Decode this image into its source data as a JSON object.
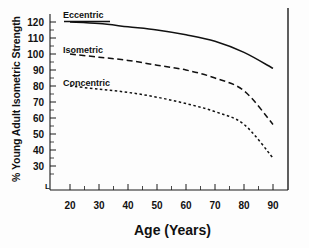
{
  "chart_data": {
    "type": "line",
    "title": "",
    "subtitle": "",
    "xlabel": "Age (Years)",
    "ylabel": "% Young Adult Isometric Strength",
    "xlim": [
      15,
      95
    ],
    "ylim": [
      25,
      127
    ],
    "xticks": [
      20,
      30,
      40,
      50,
      60,
      70,
      80,
      90
    ],
    "xtick_labels": [
      "20",
      "30",
      "40",
      "50",
      "60",
      "70",
      "80",
      "90"
    ],
    "yticks": [
      30,
      40,
      50,
      60,
      70,
      80,
      90,
      100,
      110,
      120
    ],
    "ytick_labels": [
      "30",
      "40",
      "50",
      "60",
      "70",
      "80",
      "90",
      "100",
      "110",
      "120"
    ],
    "grid": false,
    "legend_position": "inline-annotations",
    "x": [
      20,
      30,
      40,
      50,
      60,
      70,
      80,
      90
    ],
    "series": [
      {
        "name": "Eccentric",
        "style": "solid",
        "color": "#111111",
        "values": [
          120,
          119,
          117,
          115,
          112,
          108,
          101,
          91
        ]
      },
      {
        "name": "Isometric",
        "style": "dashed",
        "color": "#111111",
        "values": [
          100,
          98,
          96,
          93,
          90,
          85,
          77,
          56
        ]
      },
      {
        "name": "Concentric",
        "style": "dotted",
        "color": "#111111",
        "values": [
          80,
          78,
          76,
          73,
          69,
          64,
          56,
          35
        ]
      }
    ],
    "annotations": [
      {
        "text": "Eccentric",
        "x": 24,
        "y": 125
      },
      {
        "text": "Isometric",
        "x": 24,
        "y": 105
      },
      {
        "text": "Concentric",
        "x": 24,
        "y": 85
      }
    ],
    "axis_corner_mark": "L"
  },
  "axes": {
    "y_label": "% Young Adult Isometric Strength",
    "x_label": "Age (Years)",
    "ytick_labels": [
      "120",
      "110",
      "100",
      "90",
      "80",
      "70",
      "60",
      "50",
      "40",
      "30"
    ],
    "xtick_labels": [
      "20",
      "30",
      "40",
      "50",
      "60",
      "70",
      "80",
      "90"
    ],
    "corner_mark": "L"
  },
  "curve_labels": {
    "eccentric": "Eccentric",
    "isometric": "Isometric",
    "concentric": "Concentric"
  },
  "colors": {
    "line": "#111111",
    "axis": "#1a1a1a",
    "text": "#111111",
    "background": "#fdfdfd"
  }
}
